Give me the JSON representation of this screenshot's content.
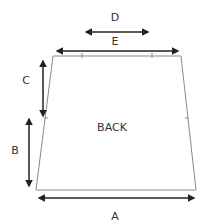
{
  "diagram": {
    "type": "garment-schematic",
    "piece_label": "BACK",
    "colors": {
      "outline": "#8a8a8a",
      "arrow": "#222222",
      "text": "#333333",
      "background": "#ffffff"
    },
    "measurements": [
      {
        "id": "A",
        "label": "A",
        "description": "bottom width"
      },
      {
        "id": "B",
        "label": "B",
        "description": "lower side height"
      },
      {
        "id": "C",
        "label": "C",
        "description": "upper side height"
      },
      {
        "id": "D",
        "label": "D",
        "description": "top center width"
      },
      {
        "id": "E",
        "label": "E",
        "description": "top width"
      }
    ]
  }
}
